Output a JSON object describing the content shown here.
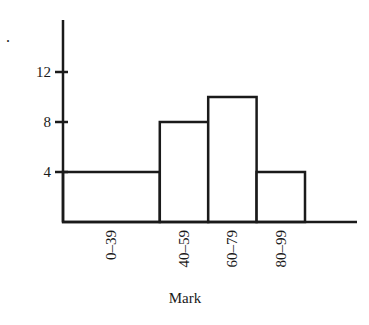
{
  "chart_data": {
    "type": "bar",
    "subtype": "histogram",
    "title": "",
    "xlabel": "Mark",
    "ylabel": "",
    "categories": [
      "0–39",
      "40–59",
      "60–79",
      "80–99"
    ],
    "bin_edges": [
      0,
      40,
      60,
      80,
      100
    ],
    "values": [
      4,
      8,
      10,
      4
    ],
    "yticks": [
      4,
      8,
      12
    ],
    "ylim": [
      0,
      16
    ],
    "grid": false,
    "legend": null,
    "stroke_color": "#1a1a1a",
    "fill_color": "#ffffff"
  },
  "marker": "."
}
